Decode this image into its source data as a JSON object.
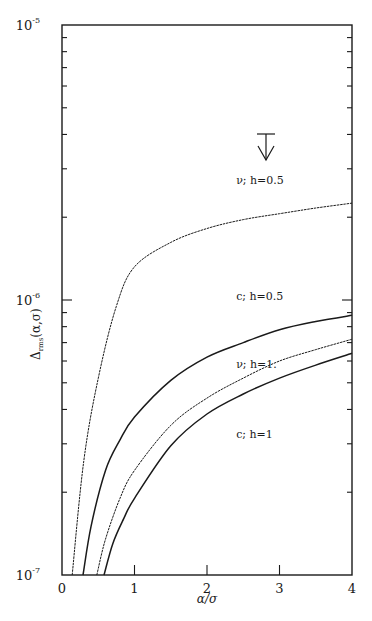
{
  "chart_data": {
    "type": "line",
    "title": "",
    "xlabel": "α/σ",
    "ylabel": "Δrms(α,σ)",
    "xlim": [
      0,
      4
    ],
    "ylim": [
      1e-07,
      1e-05
    ],
    "yscale": "log",
    "grid": false,
    "legend": "inline labels",
    "x_ticks": [
      "0",
      "1",
      "2",
      "3",
      "4"
    ],
    "y_ticks": [
      {
        "base": "10",
        "exp": "-5",
        "value": 1e-05
      },
      {
        "base": "10",
        "exp": "-6",
        "value": 1e-06
      },
      {
        "base": "10",
        "exp": "-7",
        "value": 1e-07
      }
    ],
    "series": [
      {
        "name": "ν; h=0.5",
        "style": "dotted-thin",
        "x": [
          0.14,
          0.3,
          0.5,
          0.75,
          1,
          1.5,
          2,
          2.5,
          3,
          3.5,
          4
        ],
        "y": [
          1e-07,
          2.6e-07,
          5.2e-07,
          9.5e-07,
          1.32e-06,
          1.62e-06,
          1.82e-06,
          1.96e-06,
          2.06e-06,
          2.16e-06,
          2.25e-06
        ]
      },
      {
        "name": "c; h=0.5",
        "style": "solid",
        "x": [
          0.29,
          0.4,
          0.6,
          0.8,
          1,
          1.5,
          2,
          2.5,
          3,
          3.5,
          4
        ],
        "y": [
          1e-07,
          1.5e-07,
          2.4e-07,
          3.1e-07,
          3.75e-07,
          5.1e-07,
          6.2e-07,
          7e-07,
          7.8e-07,
          8.35e-07,
          8.8e-07
        ]
      },
      {
        "name": "ν; h=1.",
        "style": "dotted-thin",
        "x": [
          0.48,
          0.6,
          0.8,
          1,
          1.5,
          2,
          2.5,
          3,
          3.5,
          4
        ],
        "y": [
          1e-07,
          1.35e-07,
          1.9e-07,
          2.4e-07,
          3.5e-07,
          4.4e-07,
          5.2e-07,
          6e-07,
          6.6e-07,
          7.2e-07
        ]
      },
      {
        "name": "c; h=1",
        "style": "solid",
        "x": [
          0.58,
          0.7,
          0.85,
          1,
          1.5,
          2,
          2.5,
          3,
          3.5,
          4
        ],
        "y": [
          1e-07,
          1.3e-07,
          1.6e-07,
          1.9e-07,
          2.95e-07,
          3.85e-07,
          4.55e-07,
          5.2e-07,
          5.8e-07,
          6.4e-07
        ]
      }
    ],
    "annotations": [
      {
        "text": "ν; h=0.5",
        "x": 2.65,
        "y_px": 184
      },
      {
        "text": "c; h=0.5",
        "x": 2.65,
        "y_px": 300
      },
      {
        "text": "ν; h=1.",
        "x": 2.65,
        "y_px": 368
      },
      {
        "text": "c; h=1",
        "x": 2.65,
        "y_px": 438
      },
      {
        "text": "upper-limit arrow",
        "x": 2.83,
        "y_px": 130
      }
    ]
  },
  "labels": {
    "x_axis_title": "α/σ",
    "y_axis_title_main": "Δ",
    "y_axis_title_sub": "rms",
    "y_axis_title_args": "(α,σ)"
  }
}
